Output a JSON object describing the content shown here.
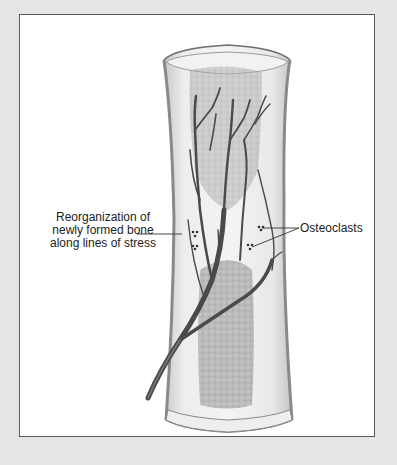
{
  "figure": {
    "labels": {
      "reorganization": [
        "Reorganization of",
        "newly formed bone",
        "along lines of stress"
      ],
      "osteoclasts": "Osteoclasts"
    },
    "colors": {
      "background": "#e5e5e5",
      "frame_fill": "#ffffff",
      "frame_border": "#5a5a5a",
      "bone_wall": "#dcdcdc",
      "marrow": "#a8a8a8",
      "vessels": "#4a4a4a"
    }
  }
}
